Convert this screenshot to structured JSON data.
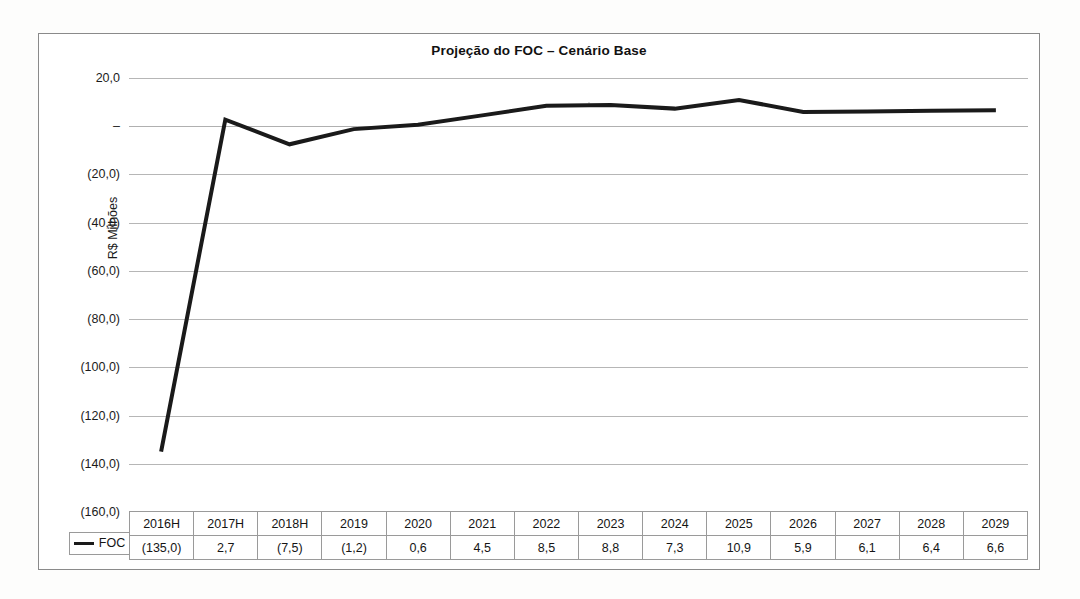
{
  "chart_data": {
    "type": "line",
    "title": "Projeção do FOC – Cenário Base",
    "xlabel": "",
    "ylabel": "R$ Milhões",
    "categories": [
      "2016H",
      "2017H",
      "2018H",
      "2019",
      "2020",
      "2021",
      "2022",
      "2023",
      "2024",
      "2025",
      "2026",
      "2027",
      "2028",
      "2029"
    ],
    "series": [
      {
        "name": "FOC",
        "color": "#1a1a1a",
        "values": [
          -135.0,
          2.7,
          -7.5,
          -1.2,
          0.6,
          4.5,
          8.5,
          8.8,
          7.3,
          10.9,
          5.9,
          6.1,
          6.4,
          6.6
        ],
        "value_labels": [
          "(135,0)",
          "2,7",
          "(7,5)",
          "(1,2)",
          "0,6",
          "4,5",
          "8,5",
          "8,8",
          "7,3",
          "10,9",
          "5,9",
          "6,1",
          "6,4",
          "6,6"
        ]
      }
    ],
    "ylim": [
      -160,
      20
    ],
    "ytick_values": [
      20,
      0,
      -20,
      -40,
      -60,
      -80,
      -100,
      -120,
      -140,
      -160
    ],
    "ytick_labels": [
      "20,0",
      "–",
      "(20,0)",
      "(40,0)",
      "(60,0)",
      "(80,0)",
      "(100,0)",
      "(120,0)",
      "(140,0)",
      "(160,0)"
    ],
    "grid": true,
    "legend_position": "bottom-left",
    "has_data_table": true
  },
  "legend": {
    "label": "FOC",
    "swatch_color": "#1a1a1a"
  },
  "table": {
    "header_row": [
      "2016H",
      "2017H",
      "2018H",
      "2019",
      "2020",
      "2021",
      "2022",
      "2023",
      "2024",
      "2025",
      "2026",
      "2027",
      "2028",
      "2029"
    ],
    "value_row": [
      "(135,0)",
      "2,7",
      "(7,5)",
      "(1,2)",
      "0,6",
      "4,5",
      "8,5",
      "8,8",
      "7,3",
      "10,9",
      "5,9",
      "6,1",
      "6,4",
      "6,6"
    ]
  },
  "colors": {
    "series_line": "#1a1a1a",
    "gridline": "#b6b6b6",
    "frame_border": "#8a8a8a",
    "table_border": "#9a9a9a",
    "background": "#ffffff"
  }
}
